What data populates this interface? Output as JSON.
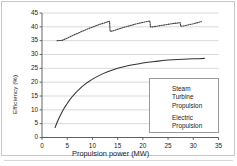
{
  "figure": {
    "title": "",
    "background": "#ffffff",
    "frame_color": "#c8c8c8"
  },
  "axes": {
    "ylabel": "Efficiency (%)",
    "xlabel": "Propulsion power  (MW)",
    "yticks": [
      "45",
      "40",
      "35",
      "30",
      "25",
      "20",
      "15",
      "10",
      "5",
      "0"
    ],
    "xticks": [
      "0",
      "5",
      "10",
      "15",
      "20",
      "25",
      "30",
      "35"
    ]
  },
  "legend": {
    "items": [
      {
        "label_lines": [
          "Steam",
          "Turbine",
          "Propulsion"
        ],
        "style": "solid",
        "color": "#333333"
      },
      {
        "label_lines": [
          "Electric",
          "Propulsion"
        ],
        "style": "dotted",
        "color": "#444444"
      }
    ]
  },
  "chart_data": {
    "type": "line",
    "title": "",
    "xlabel": "Propulsion power  (MW)",
    "ylabel": "Efficiency (%)",
    "xlim": [
      0,
      35
    ],
    "ylim": [
      0,
      45
    ],
    "xticks": [
      0,
      5,
      10,
      15,
      20,
      25,
      30,
      35
    ],
    "yticks": [
      0,
      5,
      10,
      15,
      20,
      25,
      30,
      35,
      40,
      45
    ],
    "grid": "horizontal",
    "legend_position": "lower-right",
    "series": [
      {
        "name": "Steam Turbine Propulsion",
        "style": "solid",
        "color": "#333333",
        "points": [
          [
            2.6,
            3.6
          ],
          [
            3.0,
            5.5
          ],
          [
            3.5,
            7.5
          ],
          [
            4.0,
            9.3
          ],
          [
            4.5,
            10.9
          ],
          [
            5.0,
            12.3
          ],
          [
            5.5,
            13.6
          ],
          [
            6.0,
            14.8
          ],
          [
            7.0,
            16.8
          ],
          [
            8.0,
            18.5
          ],
          [
            9.0,
            19.9
          ],
          [
            10.0,
            21.1
          ],
          [
            11.0,
            22.1
          ],
          [
            12.0,
            23.0
          ],
          [
            13.0,
            23.8
          ],
          [
            14.0,
            24.4
          ],
          [
            15.0,
            25.0
          ],
          [
            16.0,
            25.5
          ],
          [
            17.0,
            25.9
          ],
          [
            18.0,
            26.3
          ],
          [
            19.0,
            26.6
          ],
          [
            20.0,
            26.9
          ],
          [
            21.0,
            27.2
          ],
          [
            22.0,
            27.4
          ],
          [
            23.0,
            27.6
          ],
          [
            24.0,
            27.8
          ],
          [
            25.0,
            28.0
          ],
          [
            26.0,
            28.1
          ],
          [
            27.0,
            28.2
          ],
          [
            28.0,
            28.3
          ],
          [
            29.0,
            28.4
          ],
          [
            30.0,
            28.5
          ],
          [
            31.0,
            28.5
          ],
          [
            32.2,
            28.6
          ]
        ]
      },
      {
        "name": "Electric Propulsion",
        "style": "dotted",
        "color": "#444444",
        "points": [
          [
            3.0,
            35.0
          ],
          [
            4.0,
            35.1
          ],
          [
            5.0,
            35.9
          ],
          [
            6.0,
            36.8
          ],
          [
            7.0,
            37.6
          ],
          [
            8.0,
            38.4
          ],
          [
            9.0,
            39.2
          ],
          [
            10.0,
            39.9
          ],
          [
            11.0,
            40.6
          ],
          [
            12.0,
            41.2
          ],
          [
            13.0,
            41.8
          ],
          [
            13.4,
            42.0
          ],
          [
            13.5,
            38.4
          ],
          [
            14.0,
            38.5
          ],
          [
            15.0,
            39.1
          ],
          [
            16.0,
            39.7
          ],
          [
            17.0,
            40.2
          ],
          [
            18.0,
            40.7
          ],
          [
            19.0,
            41.2
          ],
          [
            20.0,
            41.6
          ],
          [
            21.0,
            42.0
          ],
          [
            21.4,
            42.1
          ],
          [
            21.5,
            40.0
          ],
          [
            22.0,
            40.0
          ],
          [
            23.0,
            40.3
          ],
          [
            24.0,
            40.6
          ],
          [
            25.0,
            40.9
          ],
          [
            26.0,
            41.2
          ],
          [
            27.0,
            41.4
          ],
          [
            27.4,
            41.5
          ],
          [
            27.5,
            40.2
          ],
          [
            28.0,
            40.3
          ],
          [
            29.0,
            40.7
          ],
          [
            30.0,
            41.1
          ],
          [
            31.0,
            41.6
          ],
          [
            31.6,
            41.9
          ]
        ]
      }
    ]
  }
}
